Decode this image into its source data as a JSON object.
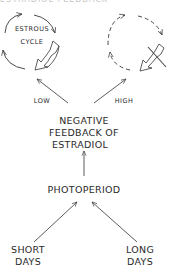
{
  "figure": {
    "top_cutoff_text": "ESTRADIOL FEEDBACK",
    "left_cycle": {
      "label_line1": "ESTROUS",
      "label_line2": "CYCLE",
      "state": "active"
    },
    "right_cycle": {
      "state": "blocked"
    },
    "edges": {
      "low_label": "LOW",
      "high_label": "HIGH"
    },
    "feedback": {
      "line1": "NEGATIVE",
      "line2": "FEEDBACK OF",
      "line3": "ESTRADIOL"
    },
    "photoperiod": {
      "label": "PHOTOPERIOD"
    },
    "short_days": {
      "line1": "SHORT",
      "line2": "DAYS"
    },
    "long_days": {
      "line1": "LONG",
      "line2": "DAYS"
    },
    "colors": {
      "stroke": "#4a4a4a",
      "text": "#2a2a2a"
    }
  }
}
